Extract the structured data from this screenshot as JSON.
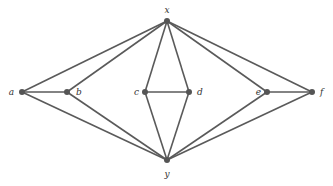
{
  "graph": {
    "nodes": [
      {
        "id": "x",
        "label": "x",
        "x": 167,
        "y": 21,
        "lx": 167,
        "ly": 13,
        "anchor": "middle"
      },
      {
        "id": "y",
        "label": "y",
        "x": 167,
        "y": 160,
        "lx": 167,
        "ly": 177,
        "anchor": "middle"
      },
      {
        "id": "a",
        "label": "a",
        "x": 22,
        "y": 92,
        "lx": 14,
        "ly": 95,
        "anchor": "end"
      },
      {
        "id": "b",
        "label": "b",
        "x": 67,
        "y": 92,
        "lx": 76,
        "ly": 95,
        "anchor": "start"
      },
      {
        "id": "c",
        "label": "c",
        "x": 145,
        "y": 92,
        "lx": 139,
        "ly": 95,
        "anchor": "end"
      },
      {
        "id": "d",
        "label": "d",
        "x": 189,
        "y": 92,
        "lx": 197,
        "ly": 95,
        "anchor": "start"
      },
      {
        "id": "e",
        "label": "e",
        "x": 267,
        "y": 92,
        "lx": 261,
        "ly": 95,
        "anchor": "end"
      },
      {
        "id": "f",
        "label": "f",
        "x": 312,
        "y": 92,
        "lx": 320,
        "ly": 95,
        "anchor": "start"
      }
    ],
    "edges": [
      [
        "x",
        "a"
      ],
      [
        "x",
        "b"
      ],
      [
        "x",
        "c"
      ],
      [
        "x",
        "d"
      ],
      [
        "x",
        "e"
      ],
      [
        "x",
        "f"
      ],
      [
        "y",
        "a"
      ],
      [
        "y",
        "b"
      ],
      [
        "y",
        "c"
      ],
      [
        "y",
        "d"
      ],
      [
        "y",
        "e"
      ],
      [
        "y",
        "f"
      ],
      [
        "a",
        "b"
      ],
      [
        "c",
        "d"
      ],
      [
        "e",
        "f"
      ]
    ]
  }
}
